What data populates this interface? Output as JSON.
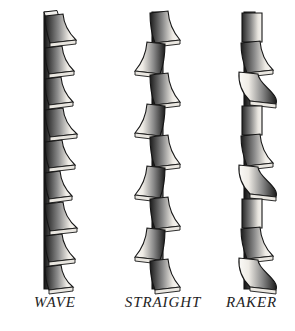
{
  "figure": {
    "background_color": "#ffffff",
    "width": 295,
    "height": 331,
    "style": "grayscale pen-and-ink technical illustration",
    "ink_color": "#1a1a1a",
    "tooth_face_light": "#f2f0ec",
    "tooth_face_dark": "#1d1d1d",
    "blade_body_color": "#2b2b2b"
  },
  "blades": [
    {
      "id": "wave",
      "label": "WAVE",
      "description": "Teeth set in a gradual wave, groups of teeth bending progressively to one side then the other",
      "tooth_count": 9,
      "pattern": [
        "right",
        "right",
        "right",
        "right",
        "right",
        "right",
        "right",
        "right",
        "right"
      ],
      "spine_x": 46,
      "spine_width": 9,
      "top_y": 14,
      "bottom_y": 289,
      "segment_height": 30
    },
    {
      "id": "straight",
      "label": "STRAIGHT",
      "description": "Teeth alternate one left, one right in a regular zigzag",
      "tooth_count": 9,
      "pattern": [
        "right",
        "left",
        "right",
        "left",
        "right",
        "left",
        "right",
        "left",
        "right"
      ],
      "spine_x": 154,
      "spine_width": 9,
      "top_y": 14,
      "bottom_y": 289,
      "segment_height": 30
    },
    {
      "id": "raker",
      "label": "RAKER",
      "description": "Repeating group of one left tooth, one right tooth and one unset raker tooth",
      "tooth_count": 9,
      "pattern": [
        "straight",
        "right",
        "left",
        "straight",
        "right",
        "left",
        "straight",
        "right",
        "left"
      ],
      "spine_x": 252,
      "spine_width": 9,
      "top_y": 14,
      "bottom_y": 289,
      "segment_height": 30
    }
  ]
}
